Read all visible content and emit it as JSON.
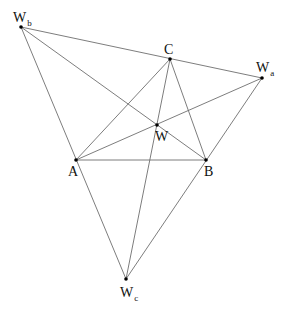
{
  "diagram": {
    "title": "",
    "points": [
      {
        "id": "A",
        "label": "A",
        "subscript": ""
      },
      {
        "id": "B",
        "label": "B",
        "subscript": ""
      },
      {
        "id": "C",
        "label": "C",
        "subscript": ""
      },
      {
        "id": "W",
        "label": "W",
        "subscript": ""
      },
      {
        "id": "Wa",
        "label": "W",
        "subscript": "a"
      },
      {
        "id": "Wb",
        "label": "W",
        "subscript": "b"
      },
      {
        "id": "Wc",
        "label": "W",
        "subscript": "c"
      }
    ],
    "segments": [
      [
        "A",
        "B"
      ],
      [
        "B",
        "C"
      ],
      [
        "C",
        "A"
      ],
      [
        "Wb",
        "Wa"
      ],
      [
        "Wb",
        "B"
      ],
      [
        "Wb",
        "Wc"
      ],
      [
        "Wa",
        "A"
      ],
      [
        "Wa",
        "Wc"
      ],
      [
        "C",
        "Wc"
      ]
    ],
    "colors": {
      "line": "#6e6e6e",
      "point": "#000000",
      "text": "#111111"
    }
  }
}
